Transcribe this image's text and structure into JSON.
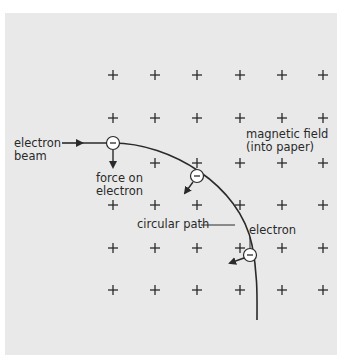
{
  "diagram": {
    "title": "",
    "labels": {
      "electron_beam_line1": "electron",
      "electron_beam_line2": "beam",
      "force_line1": "force on",
      "force_line2": "electron",
      "field_line1": "magnetic field",
      "field_line2": "(into paper)",
      "circular_path": "circular path",
      "electron": "electron"
    },
    "field_symbol": "+",
    "electron_symbol": "−",
    "colors": {
      "background": "#e9e9e9",
      "ink": "#2a2a2a",
      "electron_fill": "#ffffff"
    },
    "grid": {
      "columns_x": [
        113,
        155,
        197,
        240,
        282,
        323
      ],
      "rows_y": [
        75,
        118,
        163,
        205,
        248,
        290
      ],
      "omitted": [
        [
          2,
          0
        ]
      ]
    },
    "electrons": [
      {
        "x": 113,
        "y": 143,
        "force_direction": "down"
      },
      {
        "x": 197,
        "y": 176,
        "force_direction": "down-left"
      },
      {
        "x": 250,
        "y": 255,
        "force_direction": "left"
      }
    ]
  }
}
